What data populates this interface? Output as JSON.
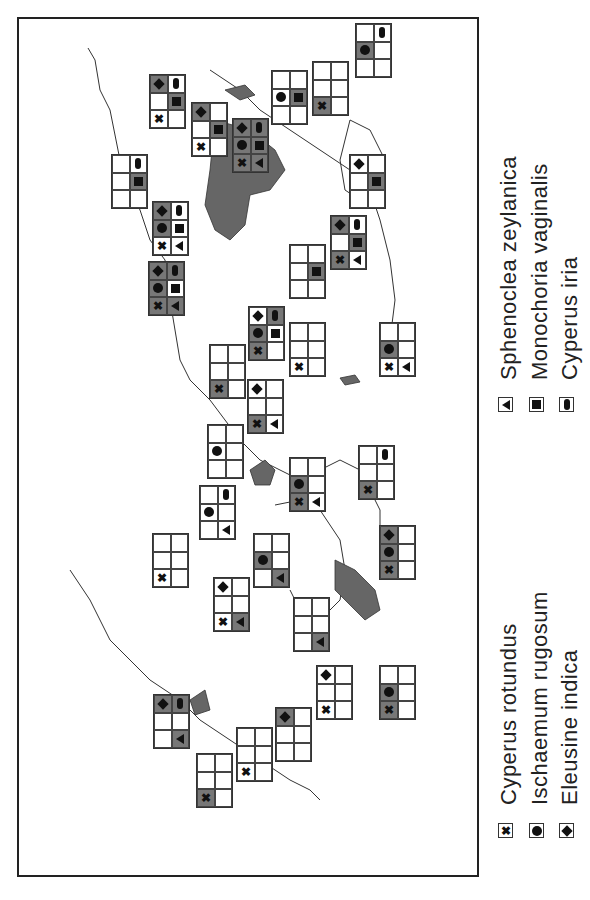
{
  "colors": {
    "present_shade": "#777777",
    "outline": "#333333",
    "land_shade": "#666666",
    "background": "#ffffff"
  },
  "legend": [
    {
      "symbol": "x",
      "icon": "cross-icon",
      "label": "Cyperus rotundus",
      "grid_pos": "col1-row3"
    },
    {
      "symbol": "dot",
      "icon": "circle-icon",
      "label": "Ischaemum rugosum",
      "grid_pos": "col1-row2"
    },
    {
      "symbol": "dia",
      "icon": "diamond-icon",
      "label": "Eleusine indica",
      "grid_pos": "col1-row1"
    },
    {
      "symbol": "tri",
      "icon": "triangle-icon",
      "label": "Sphenoclea zeylanica",
      "grid_pos": "col2-row3"
    },
    {
      "symbol": "sq",
      "icon": "square-icon",
      "label": "Monochoria vaginalis",
      "grid_pos": "col2-row2"
    },
    {
      "symbol": "ov",
      "icon": "oval-icon",
      "label": "Cyperus iria",
      "grid_pos": "col2-row1"
    }
  ],
  "boxes": [
    {
      "x": 355,
      "y": 23,
      "cells": [
        "",
        "ov:w",
        "dot:g",
        "",
        "",
        ""
      ]
    },
    {
      "x": 312,
      "y": 61,
      "cells": [
        "",
        "",
        "",
        "",
        "x:g",
        ""
      ]
    },
    {
      "x": 271,
      "y": 70,
      "cells": [
        "",
        "",
        "dot:w",
        "sq:g",
        "",
        ""
      ]
    },
    {
      "x": 232,
      "y": 118,
      "cells": [
        "dia:g",
        "ov:g",
        "dot:g",
        "sq:g",
        "x:g",
        "tri:g"
      ]
    },
    {
      "x": 191,
      "y": 102,
      "cells": [
        "dia:g",
        "",
        "",
        "sq:g",
        "x:w",
        ""
      ]
    },
    {
      "x": 149,
      "y": 74,
      "cells": [
        "dia:g",
        "ov:w",
        "",
        "sq:g",
        "x:w",
        ""
      ]
    },
    {
      "x": 111,
      "y": 154,
      "cells": [
        "",
        "ov:w",
        "",
        "sq:g",
        "",
        ""
      ]
    },
    {
      "x": 152,
      "y": 201,
      "cells": [
        "dia:g",
        "ov:w",
        "dot:g",
        "sq:w",
        "x:w",
        "tri:w"
      ]
    },
    {
      "x": 148,
      "y": 261,
      "cells": [
        "dia:g",
        "ov:g",
        "dot:g",
        "sq:w",
        "x:g",
        "tri:g"
      ]
    },
    {
      "x": 349,
      "y": 154,
      "cells": [
        "dia:w",
        "",
        "",
        "sq:g",
        "",
        ""
      ]
    },
    {
      "x": 330,
      "y": 215,
      "cells": [
        "dia:g",
        "ov:w",
        "",
        "sq:g",
        "x:g",
        "tri:w"
      ]
    },
    {
      "x": 289,
      "y": 244,
      "cells": [
        "",
        "",
        "",
        "sq:g",
        "",
        ""
      ]
    },
    {
      "x": 248,
      "y": 306,
      "cells": [
        "dia:w",
        "ov:g",
        "dot:g",
        "sq:w",
        "x:g",
        ""
      ]
    },
    {
      "x": 289,
      "y": 322,
      "cells": [
        "",
        "",
        "",
        "",
        "x:w",
        ""
      ]
    },
    {
      "x": 379,
      "y": 322,
      "cells": [
        "",
        "",
        "dot:g",
        "",
        "x:w",
        "tri:w"
      ]
    },
    {
      "x": 209,
      "y": 344,
      "cells": [
        "",
        "",
        "",
        "",
        "x:g",
        ""
      ]
    },
    {
      "x": 247,
      "y": 379,
      "cells": [
        "dia:w",
        "",
        "",
        "",
        "x:g",
        "tri:w"
      ]
    },
    {
      "x": 207,
      "y": 424,
      "cells": [
        "",
        "",
        "dot:w",
        "",
        "",
        ""
      ]
    },
    {
      "x": 289,
      "y": 457,
      "cells": [
        "",
        "",
        "dot:g",
        "",
        "x:g",
        "tri:w"
      ]
    },
    {
      "x": 358,
      "y": 445,
      "cells": [
        "",
        "ov:w",
        "",
        "",
        "x:g",
        ""
      ]
    },
    {
      "x": 199,
      "y": 485,
      "cells": [
        "",
        "ov:w",
        "dot:w",
        "",
        "",
        "tri:w"
      ]
    },
    {
      "x": 152,
      "y": 533,
      "cells": [
        "",
        "",
        "",
        "",
        "x:w",
        ""
      ]
    },
    {
      "x": 253,
      "y": 533,
      "cells": [
        "",
        "",
        "dot:g",
        "",
        "",
        "tri:g"
      ]
    },
    {
      "x": 379,
      "y": 525,
      "cells": [
        "dia:g",
        "",
        "dot:g",
        "",
        "x:g",
        ""
      ]
    },
    {
      "x": 213,
      "y": 577,
      "cells": [
        "dia:w",
        "",
        "",
        "",
        "x:w",
        "tri:g"
      ]
    },
    {
      "x": 293,
      "y": 597,
      "cells": [
        "",
        "",
        "",
        "",
        "",
        "tri:g"
      ]
    },
    {
      "x": 316,
      "y": 665,
      "cells": [
        "dia:w",
        "",
        "",
        "",
        "x:w",
        ""
      ]
    },
    {
      "x": 379,
      "y": 665,
      "cells": [
        "",
        "",
        "dot:g",
        "",
        "x:g",
        ""
      ]
    },
    {
      "x": 153,
      "y": 694,
      "cells": [
        "dia:g",
        "ov:g",
        "",
        "",
        "",
        "tri:g"
      ]
    },
    {
      "x": 275,
      "y": 707,
      "cells": [
        "dia:g",
        "",
        "",
        "",
        "",
        ""
      ]
    },
    {
      "x": 236,
      "y": 727,
      "cells": [
        "",
        "",
        "",
        "",
        "x:w",
        ""
      ]
    },
    {
      "x": 196,
      "y": 753,
      "cells": [
        "",
        "",
        "",
        "",
        "x:g",
        ""
      ]
    }
  ]
}
